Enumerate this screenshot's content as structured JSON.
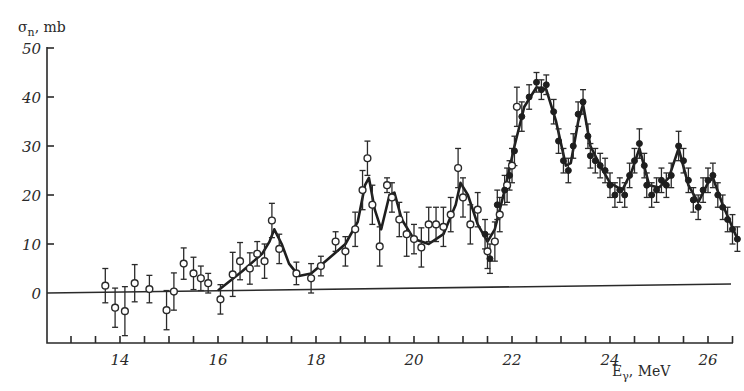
{
  "chart_data": {
    "type": "scatter",
    "title": "",
    "xlabel": "E_γ, MeV",
    "ylabel": "σ_n, mb",
    "xlim": [
      12.5,
      26.5
    ],
    "ylim": [
      -10,
      50
    ],
    "x_ticks": [
      14,
      16,
      18,
      20,
      22,
      24,
      26
    ],
    "x_tick_labels": [
      "14",
      "16",
      "18",
      "20",
      "22",
      "24",
      "26"
    ],
    "x_minor_tick_step": 0.5,
    "y_ticks": [
      0,
      10,
      20,
      30,
      40,
      50
    ],
    "y_tick_labels": [
      "0",
      "10",
      "20",
      "30",
      "40",
      "50"
    ],
    "grid": false,
    "legend": null,
    "zero_line": true,
    "series": [
      {
        "name": "open circles",
        "marker": "open-circle",
        "points": [
          {
            "x": 13.7,
            "y": 1.5,
            "err": 3.5
          },
          {
            "x": 13.9,
            "y": -3.0,
            "err": 4.0
          },
          {
            "x": 14.1,
            "y": -3.7,
            "err": 5.0
          },
          {
            "x": 14.3,
            "y": 2.0,
            "err": 3.8
          },
          {
            "x": 14.6,
            "y": 0.8,
            "err": 2.8
          },
          {
            "x": 14.95,
            "y": -3.5,
            "err": 4.0
          },
          {
            "x": 15.1,
            "y": 0.3,
            "err": 3.8
          },
          {
            "x": 15.3,
            "y": 6.0,
            "err": 3.2
          },
          {
            "x": 15.5,
            "y": 4.0,
            "err": 3.3
          },
          {
            "x": 15.65,
            "y": 3.0,
            "err": 2.5
          },
          {
            "x": 15.8,
            "y": 2.0,
            "err": 2.0
          },
          {
            "x": 16.05,
            "y": -1.3,
            "err": 3.0
          },
          {
            "x": 16.3,
            "y": 3.8,
            "err": 4.5
          },
          {
            "x": 16.45,
            "y": 6.5,
            "err": 3.8
          },
          {
            "x": 16.65,
            "y": 5.0,
            "err": 3.2
          },
          {
            "x": 16.8,
            "y": 8.0,
            "err": 2.5
          },
          {
            "x": 16.95,
            "y": 6.5,
            "err": 3.5
          },
          {
            "x": 17.1,
            "y": 14.8,
            "err": 3.5
          },
          {
            "x": 17.25,
            "y": 9.0,
            "err": 3.0
          },
          {
            "x": 17.6,
            "y": 4.0,
            "err": 2.3
          },
          {
            "x": 17.9,
            "y": 3.0,
            "err": 3.0
          },
          {
            "x": 18.1,
            "y": 5.5,
            "err": 2.0
          },
          {
            "x": 18.4,
            "y": 10.5,
            "err": 2.0
          },
          {
            "x": 18.6,
            "y": 8.5,
            "err": 3.0
          },
          {
            "x": 18.8,
            "y": 13.0,
            "err": 3.5
          },
          {
            "x": 18.95,
            "y": 21.0,
            "err": 4.0
          },
          {
            "x": 19.05,
            "y": 27.5,
            "err": 3.5
          },
          {
            "x": 19.15,
            "y": 18.0,
            "err": 4.0
          },
          {
            "x": 19.3,
            "y": 9.5,
            "err": 4.0
          },
          {
            "x": 19.45,
            "y": 22.0,
            "err": 1.5
          },
          {
            "x": 19.55,
            "y": 19.5,
            "err": 3.0
          },
          {
            "x": 19.7,
            "y": 15.0,
            "err": 3.5
          },
          {
            "x": 19.85,
            "y": 12.0,
            "err": 4.5
          },
          {
            "x": 20.0,
            "y": 11.0,
            "err": 3.0
          },
          {
            "x": 20.15,
            "y": 9.3,
            "err": 4.0
          },
          {
            "x": 20.3,
            "y": 14.0,
            "err": 3.5
          },
          {
            "x": 20.45,
            "y": 14.0,
            "err": 3.5
          },
          {
            "x": 20.6,
            "y": 13.5,
            "err": 4.0
          },
          {
            "x": 20.75,
            "y": 16.0,
            "err": 3.5
          },
          {
            "x": 20.9,
            "y": 25.5,
            "err": 4.0
          },
          {
            "x": 21.0,
            "y": 19.5,
            "err": 4.0
          },
          {
            "x": 21.15,
            "y": 14.0,
            "err": 4.0
          },
          {
            "x": 21.3,
            "y": 17.0,
            "err": 3.5
          },
          {
            "x": 21.5,
            "y": 8.5,
            "err": 3.5
          },
          {
            "x": 21.65,
            "y": 10.5,
            "err": 4.0
          },
          {
            "x": 21.75,
            "y": 16.0,
            "err": 3.5
          },
          {
            "x": 21.9,
            "y": 22.0,
            "err": 3.5
          },
          {
            "x": 22.0,
            "y": 26.0,
            "err": 3.5
          },
          {
            "x": 22.1,
            "y": 38.0,
            "err": 4.0
          }
        ]
      },
      {
        "name": "filled circles",
        "marker": "filled-circle",
        "points": [
          {
            "x": 21.45,
            "y": 12.0,
            "err": 3.0
          },
          {
            "x": 21.55,
            "y": 7.0,
            "err": 3.0
          },
          {
            "x": 21.7,
            "y": 18.0,
            "err": 3.0
          },
          {
            "x": 21.85,
            "y": 21.0,
            "err": 3.0
          },
          {
            "x": 21.95,
            "y": 24.0,
            "err": 3.0
          },
          {
            "x": 22.05,
            "y": 29.0,
            "err": 3.0
          },
          {
            "x": 22.2,
            "y": 36.0,
            "err": 3.0
          },
          {
            "x": 22.35,
            "y": 40.0,
            "err": 2.5
          },
          {
            "x": 22.5,
            "y": 43.0,
            "err": 2.0
          },
          {
            "x": 22.6,
            "y": 41.5,
            "err": 2.0
          },
          {
            "x": 22.7,
            "y": 42.5,
            "err": 2.0
          },
          {
            "x": 22.85,
            "y": 37.0,
            "err": 2.5
          },
          {
            "x": 22.95,
            "y": 31.0,
            "err": 2.5
          },
          {
            "x": 23.05,
            "y": 27.0,
            "err": 2.5
          },
          {
            "x": 23.15,
            "y": 25.0,
            "err": 2.5
          },
          {
            "x": 23.25,
            "y": 30.0,
            "err": 2.5
          },
          {
            "x": 23.35,
            "y": 36.5,
            "err": 2.5
          },
          {
            "x": 23.45,
            "y": 39.0,
            "err": 2.5
          },
          {
            "x": 23.55,
            "y": 32.0,
            "err": 2.5
          },
          {
            "x": 23.6,
            "y": 28.0,
            "err": 2.5
          },
          {
            "x": 23.7,
            "y": 27.0,
            "err": 2.5
          },
          {
            "x": 23.8,
            "y": 26.0,
            "err": 2.5
          },
          {
            "x": 23.9,
            "y": 25.0,
            "err": 2.5
          },
          {
            "x": 24.0,
            "y": 22.0,
            "err": 2.5
          },
          {
            "x": 24.1,
            "y": 20.0,
            "err": 2.5
          },
          {
            "x": 24.2,
            "y": 21.0,
            "err": 2.5
          },
          {
            "x": 24.3,
            "y": 20.0,
            "err": 2.5
          },
          {
            "x": 24.4,
            "y": 24.0,
            "err": 2.5
          },
          {
            "x": 24.5,
            "y": 27.0,
            "err": 2.5
          },
          {
            "x": 24.6,
            "y": 30.5,
            "err": 3.0
          },
          {
            "x": 24.7,
            "y": 26.0,
            "err": 2.5
          },
          {
            "x": 24.75,
            "y": 22.0,
            "err": 2.5
          },
          {
            "x": 24.85,
            "y": 20.0,
            "err": 2.5
          },
          {
            "x": 24.95,
            "y": 21.0,
            "err": 2.5
          },
          {
            "x": 25.05,
            "y": 23.0,
            "err": 2.5
          },
          {
            "x": 25.15,
            "y": 22.0,
            "err": 2.5
          },
          {
            "x": 25.25,
            "y": 24.0,
            "err": 2.5
          },
          {
            "x": 25.4,
            "y": 30.0,
            "err": 3.0
          },
          {
            "x": 25.5,
            "y": 27.0,
            "err": 2.5
          },
          {
            "x": 25.6,
            "y": 23.0,
            "err": 2.5
          },
          {
            "x": 25.7,
            "y": 19.0,
            "err": 2.5
          },
          {
            "x": 25.8,
            "y": 17.5,
            "err": 2.5
          },
          {
            "x": 25.9,
            "y": 21.0,
            "err": 2.5
          },
          {
            "x": 26.0,
            "y": 23.0,
            "err": 2.5
          },
          {
            "x": 26.1,
            "y": 24.0,
            "err": 2.5
          },
          {
            "x": 26.2,
            "y": 20.0,
            "err": 2.5
          },
          {
            "x": 26.3,
            "y": 17.5,
            "err": 2.5
          },
          {
            "x": 26.4,
            "y": 15.0,
            "err": 2.5
          },
          {
            "x": 26.5,
            "y": 13.0,
            "err": 3.0
          },
          {
            "x": 26.6,
            "y": 11.0,
            "err": 2.5
          }
        ]
      },
      {
        "name": "fit curve",
        "marker": "line",
        "points": [
          {
            "x": 16.0,
            "y": 0.5
          },
          {
            "x": 16.5,
            "y": 4.5
          },
          {
            "x": 16.9,
            "y": 8.0
          },
          {
            "x": 17.05,
            "y": 10.5
          },
          {
            "x": 17.15,
            "y": 13.0
          },
          {
            "x": 17.3,
            "y": 10.0
          },
          {
            "x": 17.45,
            "y": 6.0
          },
          {
            "x": 17.65,
            "y": 3.5
          },
          {
            "x": 17.9,
            "y": 4.0
          },
          {
            "x": 18.2,
            "y": 6.5
          },
          {
            "x": 18.6,
            "y": 10.0
          },
          {
            "x": 18.85,
            "y": 14.5
          },
          {
            "x": 19.0,
            "y": 22.0
          },
          {
            "x": 19.08,
            "y": 23.5
          },
          {
            "x": 19.2,
            "y": 17.0
          },
          {
            "x": 19.33,
            "y": 13.0
          },
          {
            "x": 19.5,
            "y": 20.0
          },
          {
            "x": 19.6,
            "y": 20.5
          },
          {
            "x": 19.75,
            "y": 15.0
          },
          {
            "x": 20.0,
            "y": 11.0
          },
          {
            "x": 20.3,
            "y": 10.0
          },
          {
            "x": 20.6,
            "y": 12.0
          },
          {
            "x": 20.85,
            "y": 18.0
          },
          {
            "x": 20.95,
            "y": 22.5
          },
          {
            "x": 21.1,
            "y": 20.0
          },
          {
            "x": 21.3,
            "y": 14.0
          },
          {
            "x": 21.5,
            "y": 10.5
          },
          {
            "x": 21.65,
            "y": 13.0
          },
          {
            "x": 21.85,
            "y": 21.0
          },
          {
            "x": 22.05,
            "y": 30.0
          },
          {
            "x": 22.25,
            "y": 38.0
          },
          {
            "x": 22.5,
            "y": 42.0
          },
          {
            "x": 22.7,
            "y": 41.5
          },
          {
            "x": 22.9,
            "y": 35.0
          },
          {
            "x": 23.1,
            "y": 26.0
          },
          {
            "x": 23.2,
            "y": 26.5
          },
          {
            "x": 23.35,
            "y": 35.0
          },
          {
            "x": 23.45,
            "y": 38.5
          },
          {
            "x": 23.6,
            "y": 30.0
          },
          {
            "x": 23.8,
            "y": 26.0
          },
          {
            "x": 24.0,
            "y": 22.5
          },
          {
            "x": 24.25,
            "y": 21.0
          },
          {
            "x": 24.45,
            "y": 25.0
          },
          {
            "x": 24.6,
            "y": 29.5
          },
          {
            "x": 24.8,
            "y": 22.0
          },
          {
            "x": 25.0,
            "y": 21.5
          },
          {
            "x": 25.2,
            "y": 23.5
          },
          {
            "x": 25.4,
            "y": 29.5
          },
          {
            "x": 25.6,
            "y": 22.0
          },
          {
            "x": 25.8,
            "y": 18.5
          },
          {
            "x": 26.0,
            "y": 22.5
          },
          {
            "x": 26.1,
            "y": 23.5
          },
          {
            "x": 26.3,
            "y": 18.0
          },
          {
            "x": 26.6,
            "y": 11.0
          }
        ]
      }
    ],
    "layout_px": {
      "x0_value": 14,
      "x0_px": 120,
      "px_per_x": 49,
      "y0_value": 0,
      "y0_px": 293,
      "px_per_y": 4.9,
      "axis_left_px": 47,
      "axis_top_px": 47,
      "axis_bottom_px": 343,
      "axis_right_px": 733,
      "zero_line_right_px": 731,
      "zero_line_right_y_px": 284
    }
  }
}
